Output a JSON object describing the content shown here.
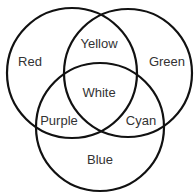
{
  "diagram": {
    "type": "venn",
    "sets": [
      {
        "id": "red",
        "label": "Red"
      },
      {
        "id": "green",
        "label": "Green"
      },
      {
        "id": "blue",
        "label": "Blue"
      }
    ],
    "regions": {
      "red": "Red",
      "green": "Green",
      "blue": "Blue",
      "red_green": "Yellow",
      "red_blue": "Purple",
      "green_blue": "Cyan",
      "all": "White"
    }
  }
}
